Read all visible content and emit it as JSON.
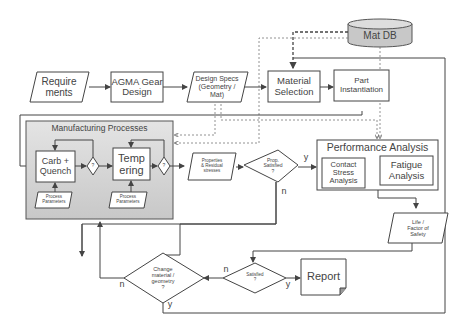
{
  "nodes": {
    "requirements": "Require\nments",
    "agma": "AGMA Gear\nDesign",
    "design_specs": "Design Specs\n(Geometry /\nMat)",
    "material_selection": "Material\nSelection",
    "part_instantiation": "Part\nInstantiation",
    "mat_db": "Mat DB",
    "manufacturing": "Manufacturing Processes",
    "carb_quench": "Carb +\nQuench",
    "tempering": "Temp\nering",
    "process_params_1": "Process\nParameters",
    "process_params_2": "Process\nParameters",
    "properties": "Properties\n& Residual\nstresses",
    "prop_satisfied": "Prop.\nSatisfied\n?",
    "performance": "Performance Analysis",
    "contact_stress": "Contact\nStress\nAnalysis",
    "fatigue": "Fatigue\nAnalysis",
    "life": "Life /\nFactor of\nSafety",
    "change": "Change\nmaterial /\ngeometry\n?",
    "satisfied": "Satisfied\n?",
    "report": "Report"
  },
  "labels": {
    "prop_y": "y",
    "prop_n": "n",
    "sat_n": "n",
    "sat_y": "y",
    "change_n": "n",
    "change_y": "y",
    "small_diamond_1": "?",
    "small_diamond_2": "?"
  },
  "colors": {
    "line": "#444444",
    "dashed": "#777777",
    "mfg_fill": "#d4d4d4",
    "db_fill": "#c8c8c8"
  }
}
